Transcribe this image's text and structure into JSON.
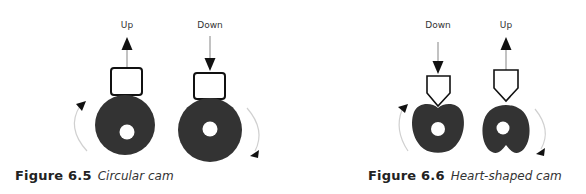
{
  "figures": [
    {
      "number": "Figure 6.5",
      "title": "Circular cam",
      "cams": [
        {
          "shape": "circle",
          "follower": "flat",
          "motion_label": "Up",
          "rotation": "counterclockwise"
        },
        {
          "shape": "circle",
          "follower": "flat",
          "motion_label": "Down",
          "rotation": "clockwise"
        }
      ]
    },
    {
      "number": "Figure 6.6",
      "title": "Heart-shaped cam",
      "cams": [
        {
          "shape": "heart",
          "follower": "pointed",
          "motion_label": "Down",
          "rotation": "counterclockwise"
        },
        {
          "shape": "heart-inverted",
          "follower": "pointed",
          "motion_label": "Up",
          "rotation": "clockwise"
        }
      ]
    }
  ],
  "colors": {
    "cam_fill": "#333333",
    "arc_stroke": "#d0d0d0",
    "arrow": "#111111",
    "motion_line": "#999999"
  }
}
